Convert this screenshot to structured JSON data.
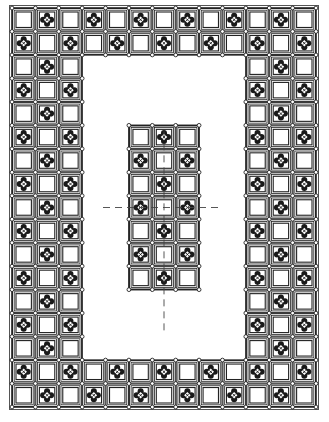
{
  "drawing": {
    "title": "Tiled floor pattern plan",
    "grid": {
      "columns": 13,
      "rows": 17
    },
    "pattern": "checkerboard",
    "decorated_rule": "row+column odd",
    "void": {
      "col_start": 3,
      "col_end": 9,
      "row_start": 2,
      "row_end": 14
    },
    "center_panel": {
      "col_start": 5,
      "col_end": 7,
      "row_start": 5,
      "row_end": 11
    },
    "tile_types": {
      "plain": "plain-tile",
      "decorated": "quatrefoil-tile"
    },
    "centerlines": [
      {
        "orientation": "horizontal",
        "style": "dashed",
        "through": "center-row"
      },
      {
        "orientation": "vertical",
        "style": "dashed",
        "through": "center-column",
        "extends": "below-panel"
      }
    ],
    "colors": {
      "line": "#222222",
      "fill": "#ffffff",
      "motif": "#1a1a1a",
      "frame": "#555555"
    }
  }
}
